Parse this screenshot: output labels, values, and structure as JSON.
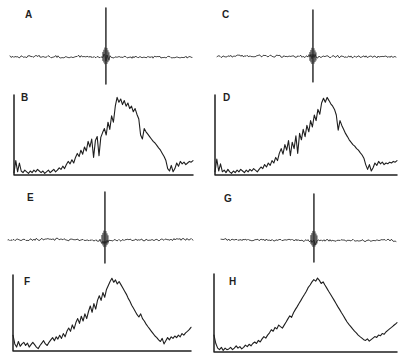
{
  "figure": {
    "kind": "multi-panel scientific figure",
    "panel_labels": [
      "A",
      "B",
      "C",
      "D",
      "E",
      "F",
      "G",
      "H"
    ],
    "colors": {
      "background": "#ffffff",
      "stroke": "#1f1f1f",
      "label": "#1f1f1f"
    },
    "axes_note": "panels B, D, F, H have unlabeled left+bottom axes; panels A, C, E, G are bare traces; no tick marks, no numeric labels, no title"
  },
  "chart_data": [
    {
      "panel": "A",
      "type": "line",
      "subtype": "impulse-trace",
      "description": "flat noisy horizontal trace with one sharp central spike (up and down)",
      "x_range": [
        0,
        1
      ],
      "spike_x": 0.527,
      "spike_peak": 1.0,
      "spike_trough": -0.55,
      "noise_amplitude": 0.022,
      "burst_amplitude": 0.17,
      "burst_half_width": 0.03,
      "seed": 7
    },
    {
      "panel": "B",
      "type": "line",
      "subtype": "spectrum-hump",
      "description": "jagged broad hump rising from near zero, apex near x=0.57, deep notches on flanks, dip then low tail at right",
      "x_range": [
        0,
        1
      ],
      "ylim": [
        0,
        1
      ],
      "axes": {
        "left": true,
        "bottom": true,
        "ticks": "none"
      },
      "values": [
        0.03,
        0.18,
        0.04,
        0.15,
        0.05,
        0.03,
        0.06,
        0.04,
        0.02,
        0.05,
        0.03,
        0.06,
        0.04,
        0.07,
        0.05,
        0.03,
        0.05,
        0.02,
        0.04,
        0.06,
        0.03,
        0.05,
        0.07,
        0.04,
        0.06,
        0.09,
        0.07,
        0.11,
        0.08,
        0.13,
        0.17,
        0.14,
        0.19,
        0.15,
        0.22,
        0.27,
        0.23,
        0.31,
        0.26,
        0.35,
        0.3,
        0.42,
        0.35,
        0.45,
        0.22,
        0.43,
        0.48,
        0.24,
        0.47,
        0.53,
        0.58,
        0.5,
        0.66,
        0.57,
        0.74,
        0.66,
        0.86,
        0.97,
        0.91,
        0.95,
        0.88,
        0.93,
        0.86,
        0.9,
        0.83,
        0.86,
        0.79,
        0.83,
        0.76,
        0.7,
        0.5,
        0.45,
        0.58,
        0.54,
        0.51,
        0.48,
        0.45,
        0.42,
        0.4,
        0.37,
        0.34,
        0.31,
        0.27,
        0.23,
        0.18,
        0.08,
        0.05,
        0.12,
        0.04,
        0.08,
        0.15,
        0.11,
        0.17,
        0.14,
        0.16,
        0.13,
        0.15,
        0.17,
        0.16,
        0.18
      ]
    },
    {
      "panel": "C",
      "type": "line",
      "subtype": "impulse-trace",
      "description": "flat noisy horizontal trace with one sharp central spike (up and down)",
      "x_range": [
        0,
        1
      ],
      "spike_x": 0.536,
      "spike_peak": 1.0,
      "spike_trough": -0.53,
      "noise_amplitude": 0.022,
      "burst_amplitude": 0.17,
      "burst_half_width": 0.03,
      "seed": 13
    },
    {
      "panel": "D",
      "type": "line",
      "subtype": "spectrum-hump",
      "description": "jagged broad hump similar to B, apex near x=0.60, notch at x=0.67, dip then low tail at right",
      "x_range": [
        0,
        1
      ],
      "ylim": [
        0,
        1
      ],
      "axes": {
        "left": true,
        "bottom": true,
        "ticks": "none"
      },
      "values": [
        0.04,
        0.2,
        0.05,
        0.14,
        0.04,
        0.06,
        0.03,
        0.07,
        0.04,
        0.02,
        0.05,
        0.03,
        0.06,
        0.04,
        0.07,
        0.05,
        0.03,
        0.06,
        0.04,
        0.07,
        0.05,
        0.08,
        0.06,
        0.04,
        0.07,
        0.1,
        0.08,
        0.13,
        0.1,
        0.15,
        0.12,
        0.18,
        0.15,
        0.22,
        0.18,
        0.27,
        0.33,
        0.26,
        0.38,
        0.31,
        0.43,
        0.24,
        0.41,
        0.33,
        0.49,
        0.27,
        0.52,
        0.44,
        0.57,
        0.48,
        0.62,
        0.54,
        0.68,
        0.6,
        0.75,
        0.68,
        0.82,
        0.76,
        0.9,
        0.96,
        0.91,
        0.97,
        0.93,
        0.89,
        0.86,
        0.82,
        0.75,
        0.56,
        0.68,
        0.62,
        0.57,
        0.52,
        0.48,
        0.44,
        0.41,
        0.38,
        0.36,
        0.33,
        0.31,
        0.28,
        0.25,
        0.21,
        0.13,
        0.07,
        0.13,
        0.05,
        0.09,
        0.15,
        0.12,
        0.17,
        0.14,
        0.16,
        0.13,
        0.15,
        0.14,
        0.16,
        0.15,
        0.17,
        0.16,
        0.18
      ]
    },
    {
      "panel": "E",
      "type": "line",
      "subtype": "impulse-trace",
      "description": "flat noisy horizontal trace with one sharp central spike (up and down)",
      "x_range": [
        0,
        1
      ],
      "spike_x": 0.524,
      "spike_peak": 1.0,
      "spike_trough": -0.48,
      "noise_amplitude": 0.022,
      "burst_amplitude": 0.17,
      "burst_half_width": 0.03,
      "seed": 21
    },
    {
      "panel": "F",
      "type": "line",
      "subtype": "spectrum-hump",
      "description": "noisy broad hump, apex near x=0.55, gradual descent, dip near x=0.84, tail rises slightly at right",
      "x_range": [
        0,
        1
      ],
      "ylim": [
        0,
        1
      ],
      "axes": {
        "left": true,
        "bottom": true,
        "ticks": "none"
      },
      "values": [
        0.2,
        0.09,
        0.05,
        0.12,
        0.06,
        0.09,
        0.11,
        0.07,
        0.1,
        0.05,
        0.08,
        0.11,
        0.08,
        0.05,
        0.03,
        0.07,
        0.1,
        0.13,
        0.09,
        0.07,
        0.11,
        0.14,
        0.17,
        0.13,
        0.18,
        0.15,
        0.2,
        0.16,
        0.22,
        0.18,
        0.25,
        0.29,
        0.25,
        0.33,
        0.28,
        0.36,
        0.41,
        0.35,
        0.44,
        0.38,
        0.47,
        0.41,
        0.5,
        0.57,
        0.49,
        0.6,
        0.53,
        0.64,
        0.7,
        0.64,
        0.74,
        0.68,
        0.78,
        0.83,
        0.88,
        0.92,
        0.87,
        0.9,
        0.85,
        0.88,
        0.84,
        0.8,
        0.76,
        0.72,
        0.67,
        0.63,
        0.58,
        0.54,
        0.5,
        0.46,
        0.43,
        0.47,
        0.41,
        0.38,
        0.34,
        0.31,
        0.28,
        0.25,
        0.22,
        0.19,
        0.17,
        0.14,
        0.12,
        0.16,
        0.09,
        0.13,
        0.17,
        0.14,
        0.18,
        0.16,
        0.19,
        0.17,
        0.2,
        0.18,
        0.22,
        0.2,
        0.23,
        0.25,
        0.27,
        0.3
      ]
    },
    {
      "panel": "G",
      "type": "line",
      "subtype": "impulse-trace",
      "description": "flat noisy horizontal trace with one sharp central spike (up and down)",
      "x_range": [
        0,
        1
      ],
      "spike_x": 0.531,
      "spike_peak": 1.0,
      "spike_trough": -0.48,
      "noise_amplitude": 0.022,
      "burst_amplitude": 0.17,
      "burst_half_width": 0.03,
      "seed": 29
    },
    {
      "panel": "H",
      "type": "line",
      "subtype": "spectrum-hump",
      "description": "smoothest broad hump, apex near x=0.55, small shoulder at x=0.37, tail rises at right edge",
      "x_range": [
        0,
        1
      ],
      "ylim": [
        0,
        1
      ],
      "axes": {
        "left": true,
        "bottom": true,
        "ticks": "none"
      },
      "values": [
        0.22,
        0.11,
        0.05,
        0.03,
        0.06,
        0.02,
        0.05,
        0.03,
        0.04,
        0.06,
        0.03,
        0.05,
        0.08,
        0.05,
        0.07,
        0.04,
        0.06,
        0.09,
        0.07,
        0.1,
        0.08,
        0.11,
        0.13,
        0.11,
        0.15,
        0.13,
        0.17,
        0.2,
        0.18,
        0.22,
        0.25,
        0.29,
        0.27,
        0.32,
        0.3,
        0.35,
        0.33,
        0.31,
        0.35,
        0.39,
        0.43,
        0.47,
        0.45,
        0.51,
        0.55,
        0.59,
        0.63,
        0.67,
        0.71,
        0.75,
        0.79,
        0.84,
        0.87,
        0.91,
        0.94,
        0.92,
        0.96,
        0.93,
        0.89,
        0.91,
        0.87,
        0.83,
        0.79,
        0.75,
        0.71,
        0.67,
        0.63,
        0.59,
        0.55,
        0.51,
        0.47,
        0.43,
        0.39,
        0.36,
        0.33,
        0.3,
        0.27,
        0.25,
        0.22,
        0.2,
        0.18,
        0.16,
        0.15,
        0.17,
        0.14,
        0.16,
        0.18,
        0.2,
        0.19,
        0.22,
        0.21,
        0.24,
        0.23,
        0.26,
        0.28,
        0.3,
        0.32,
        0.34,
        0.36,
        0.38
      ]
    }
  ]
}
